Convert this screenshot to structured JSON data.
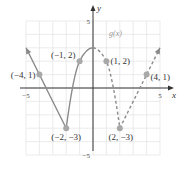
{
  "chart_data": {
    "type": "line",
    "title": "",
    "xlabel": "x",
    "ylabel": "y",
    "xlim": [
      -5,
      5
    ],
    "ylim": [
      -5,
      5
    ],
    "grid": true,
    "x_ticks": [
      {
        "value": -5,
        "label": "-5"
      },
      {
        "value": 5,
        "label": "5"
      }
    ],
    "y_ticks": [
      {
        "value": 5,
        "label": "5"
      },
      {
        "value": -5,
        "label": "-5"
      }
    ],
    "function_label": "g(x)",
    "series": [
      {
        "name": "solid-branch",
        "style": "solid",
        "segments": [
          {
            "kind": "line",
            "points": [
              [
                -5,
                3
              ],
              [
                -2,
                -3
              ]
            ],
            "arrow_start": true
          },
          {
            "kind": "curve",
            "points": [
              [
                -2,
                -3
              ],
              [
                -1,
                2
              ],
              [
                0,
                3
              ]
            ]
          }
        ]
      },
      {
        "name": "dashed-branch",
        "style": "dashed",
        "segments": [
          {
            "kind": "curve",
            "points": [
              [
                0,
                3
              ],
              [
                1,
                2
              ],
              [
                2,
                -3
              ]
            ]
          },
          {
            "kind": "line",
            "points": [
              [
                2,
                -3
              ],
              [
                5,
                3
              ]
            ],
            "arrow_end": true
          }
        ]
      }
    ],
    "labeled_points": [
      {
        "x": -4,
        "y": 1,
        "label": "(−4, 1)"
      },
      {
        "x": -1,
        "y": 2,
        "label": "(−1, 2)"
      },
      {
        "x": 1,
        "y": 2,
        "label": "(1, 2)"
      },
      {
        "x": 4,
        "y": 1,
        "label": "(4, 1)"
      },
      {
        "x": -2,
        "y": -3,
        "label": "(−2, −3)"
      },
      {
        "x": 2,
        "y": -3,
        "label": "(2, −3)"
      }
    ],
    "colors": {
      "curve": "#8a8a8a",
      "point": "#a8a8a8",
      "grid": "#e6e6e6",
      "axis": "#333333"
    }
  }
}
